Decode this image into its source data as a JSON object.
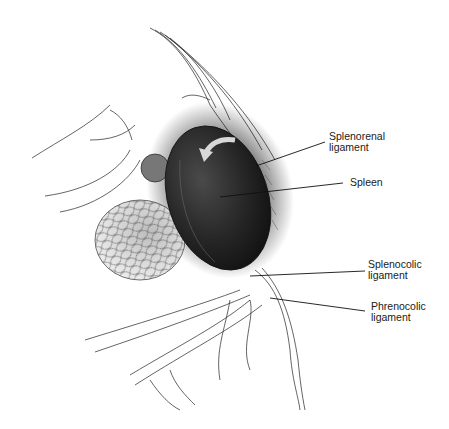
{
  "figure": {
    "labels": [
      {
        "id": "splenorenal",
        "lines": [
          "Splenorenal",
          "ligament"
        ],
        "x": 329,
        "y": 131
      },
      {
        "id": "spleen",
        "lines": [
          "Spleen"
        ],
        "x": 350,
        "y": 177
      },
      {
        "id": "splenocolic",
        "lines": [
          "Splenocolic",
          "ligament"
        ],
        "x": 368,
        "y": 259
      },
      {
        "id": "phrenocolic",
        "lines": [
          "Phrenocolic",
          "ligament"
        ],
        "x": 371,
        "y": 301
      }
    ]
  }
}
